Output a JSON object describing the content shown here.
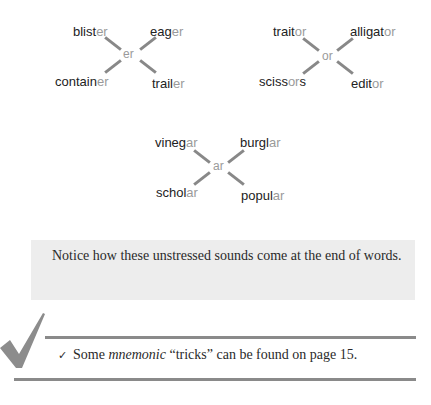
{
  "groups": [
    {
      "suffix": "er",
      "words": [
        {
          "stem": "blist",
          "suffix": "er",
          "after": ""
        },
        {
          "stem": "eag",
          "suffix": "er",
          "after": ""
        },
        {
          "stem": "contain",
          "suffix": "er",
          "after": ""
        },
        {
          "stem": "trail",
          "suffix": "er",
          "after": ""
        }
      ]
    },
    {
      "suffix": "or",
      "words": [
        {
          "stem": "trait",
          "suffix": "or",
          "after": ""
        },
        {
          "stem": "alligat",
          "suffix": "or",
          "after": ""
        },
        {
          "stem": "sciss",
          "suffix": "or",
          "after": "s"
        },
        {
          "stem": "edit",
          "suffix": "or",
          "after": ""
        }
      ]
    },
    {
      "suffix": "ar",
      "words": [
        {
          "stem": "vineg",
          "suffix": "ar",
          "after": ""
        },
        {
          "stem": "burgl",
          "suffix": "ar",
          "after": ""
        },
        {
          "stem": "schol",
          "suffix": "ar",
          "after": ""
        },
        {
          "stem": "popul",
          "suffix": "ar",
          "after": ""
        }
      ]
    }
  ],
  "note": "Notice how these unstressed sounds come at the end of words.",
  "tip": {
    "check": "✓",
    "before": "Some ",
    "italic": "mnemonic",
    "after": " “tricks” can be found on page 15."
  },
  "colors": {
    "suffix_gray": "#9a9a9a",
    "box_bg": "#ededed",
    "rule": "#8a8a8a"
  }
}
